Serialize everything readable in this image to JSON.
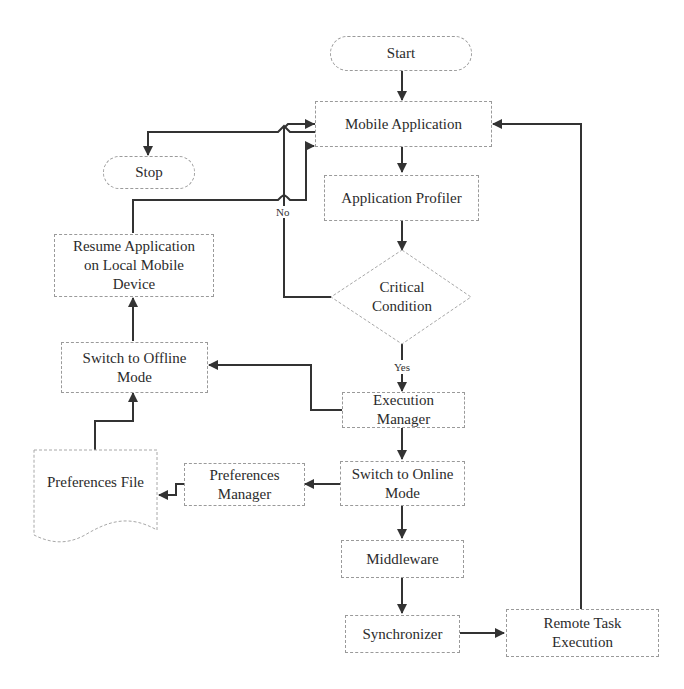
{
  "diagram": {
    "type": "flowchart",
    "nodes": {
      "start": {
        "label": "Start",
        "shape": "terminal"
      },
      "mobile_app": {
        "label": "Mobile Application",
        "shape": "process"
      },
      "stop": {
        "label": "Stop",
        "shape": "terminal"
      },
      "profiler": {
        "label": "Application Profiler",
        "shape": "process"
      },
      "critical": {
        "label": "Critical Condition",
        "shape": "decision"
      },
      "resume": {
        "label": "Resume Application on Local Mobile Device",
        "shape": "process"
      },
      "offline": {
        "label": "Switch to Offline Mode",
        "shape": "process"
      },
      "exec_mgr": {
        "label": "Execution Manager",
        "shape": "process"
      },
      "pref_file": {
        "label": "Preferences File",
        "shape": "document"
      },
      "pref_mgr": {
        "label": "Preferences Manager",
        "shape": "process"
      },
      "online": {
        "label": "Switch to Online Mode",
        "shape": "process"
      },
      "middleware": {
        "label": "Middleware",
        "shape": "process"
      },
      "sync": {
        "label": "Synchronizer",
        "shape": "process"
      },
      "remote": {
        "label": "Remote Task Execution",
        "shape": "process"
      }
    },
    "edge_labels": {
      "no": "No",
      "yes": "Yes"
    },
    "edges": [
      {
        "from": "start",
        "to": "mobile_app"
      },
      {
        "from": "mobile_app",
        "to": "stop"
      },
      {
        "from": "mobile_app",
        "to": "profiler"
      },
      {
        "from": "profiler",
        "to": "critical"
      },
      {
        "from": "critical",
        "to": "mobile_app",
        "label": "No"
      },
      {
        "from": "critical",
        "to": "exec_mgr",
        "label": "Yes"
      },
      {
        "from": "exec_mgr",
        "to": "offline"
      },
      {
        "from": "exec_mgr",
        "to": "online"
      },
      {
        "from": "offline",
        "to": "resume"
      },
      {
        "from": "resume",
        "to": "mobile_app"
      },
      {
        "from": "pref_file",
        "to": "offline"
      },
      {
        "from": "online",
        "to": "pref_mgr"
      },
      {
        "from": "pref_mgr",
        "to": "pref_file"
      },
      {
        "from": "online",
        "to": "middleware"
      },
      {
        "from": "middleware",
        "to": "sync"
      },
      {
        "from": "sync",
        "to": "remote"
      },
      {
        "from": "remote",
        "to": "mobile_app"
      }
    ]
  }
}
